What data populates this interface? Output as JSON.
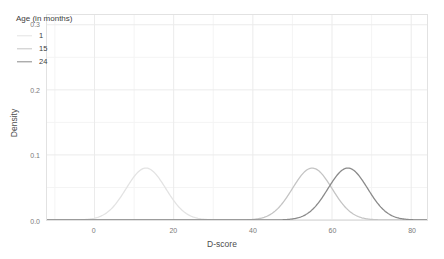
{
  "chart_data": {
    "type": "line",
    "title": "",
    "xlabel": "D-score",
    "ylabel": "Density",
    "xlim": [
      -12,
      84
    ],
    "ylim": [
      0,
      0.315
    ],
    "xticks": [
      0,
      20,
      40,
      60,
      80
    ],
    "xtick_labels": [
      "0",
      "20",
      "40",
      "60",
      "80"
    ],
    "yticks": [
      0.0,
      0.1,
      0.2,
      0.3
    ],
    "ytick_labels": [
      "0.0",
      "0.1",
      "0.2",
      "0.3"
    ],
    "grid": true,
    "legend_position": "inside top-left",
    "legend_title": "Age (in months)",
    "series": [
      {
        "name": "1",
        "label": "1",
        "color": "#e3e3e3",
        "mean": 13.0,
        "sd": 5.0,
        "peak_density": 0.0798,
        "peak_x": 13.0
      },
      {
        "name": "15",
        "label": "15",
        "color": "#c4c4c4",
        "mean": 55.0,
        "sd": 5.0,
        "peak_density": 0.0798,
        "peak_x": 55.0
      },
      {
        "name": "24",
        "label": "24",
        "color": "#8a8a8a",
        "mean": 64.0,
        "sd": 5.0,
        "peak_density": 0.0798,
        "peak_x": 64.0
      }
    ]
  },
  "style": {
    "panel_background": "#ffffff",
    "panel_border": "#e2e2e2",
    "grid_major": "#ebebeb",
    "grid_minor": "#f4f4f4",
    "axis_text": "#7a7a7a",
    "axis_title": "#4d4d4d"
  }
}
